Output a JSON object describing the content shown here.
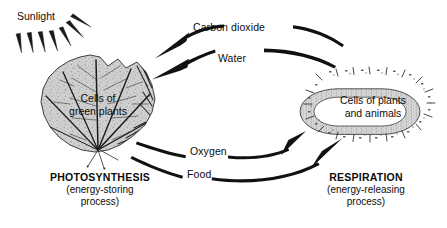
{
  "figure": {
    "type": "cycle-diagram",
    "background": "#ffffff",
    "ink": "#111111"
  },
  "sunlight": {
    "label": "Sunlight",
    "ray_count": 7
  },
  "left_entity": {
    "name": "green-leaf",
    "line1": "Cells of",
    "line2": "green plants"
  },
  "right_entity": {
    "name": "cell-ring",
    "line1": "Cells of plants",
    "line2": "and animals",
    "cell_count": 22
  },
  "flows": [
    {
      "id": "carbon-dioxide",
      "label": "Carbon dioxide",
      "direction": "right-to-left"
    },
    {
      "id": "water",
      "label": "Water",
      "direction": "right-to-left"
    },
    {
      "id": "oxygen",
      "label": "Oxygen",
      "direction": "left-to-right"
    },
    {
      "id": "food",
      "label": "Food",
      "direction": "left-to-right"
    }
  ],
  "captions": {
    "photosynthesis": {
      "title": "PHOTOSYNTHESIS",
      "sub1": "(energy-storing",
      "sub2": "process)"
    },
    "respiration": {
      "title": "RESPIRATION",
      "sub1": "(energy-releasing",
      "sub2": "process)"
    }
  }
}
